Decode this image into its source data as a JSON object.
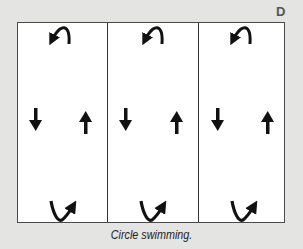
{
  "figure": {
    "panel_label": "D",
    "caption": "Circle swimming.",
    "lanes": [
      {
        "index": 1,
        "top_turn": "u-turn-left",
        "left_arrow": "down",
        "right_arrow": "up",
        "bottom_turn": "u-turn-right"
      },
      {
        "index": 2,
        "top_turn": "u-turn-left",
        "left_arrow": "down",
        "right_arrow": "up",
        "bottom_turn": "u-turn-right"
      },
      {
        "index": 3,
        "top_turn": "u-turn-left",
        "left_arrow": "down",
        "right_arrow": "up",
        "bottom_turn": "u-turn-right"
      }
    ],
    "colors": {
      "background": "#e4e4e2",
      "pool": "#ffffff",
      "ink": "#111111"
    }
  }
}
